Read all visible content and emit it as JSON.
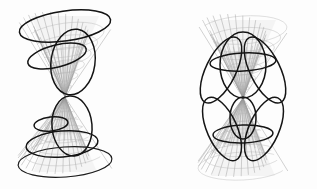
{
  "figure": {
    "width": 317,
    "height": 189,
    "background_color": "#fdfdfd",
    "mesh_color": "#9a9a9a",
    "curve_color": "#141414",
    "shade_color": "#d8d8d8",
    "panel_count": 2,
    "panels": [
      {
        "id": "left",
        "name": "non-degenerate-conics",
        "caption": "",
        "apex": {
          "x": 65,
          "y": 97
        },
        "axis_vertical": true,
        "cone": {
          "type": "double-cone",
          "upper_rim": {
            "cx": 65,
            "cy": 26,
            "rx": 46,
            "ry": 15,
            "rotation_deg": -8
          },
          "lower_rim": {
            "cx": 65,
            "cy": 162,
            "rx": 47,
            "ry": 15,
            "rotation_deg": -4
          },
          "meridian_count": 24,
          "parallel_count": 7
        },
        "conic_curves": [
          {
            "name": "upper-rim-ellipse",
            "kind": "ellipse",
            "cx": 65,
            "cy": 26,
            "rx": 46,
            "ry": 15,
            "rotation_deg": -8,
            "weight": "bold"
          },
          {
            "name": "tilted-ellipse-upper",
            "kind": "ellipse",
            "cx": 57,
            "cy": 56,
            "rx": 30,
            "ry": 11,
            "rotation_deg": -14,
            "weight": "bold"
          },
          {
            "name": "steep-ellipse-upper",
            "kind": "ellipse",
            "cx": 73,
            "cy": 62,
            "rx": 22,
            "ry": 33,
            "rotation_deg": 8,
            "weight": "bold"
          },
          {
            "name": "small-ellipse-lower",
            "kind": "ellipse",
            "cx": 51,
            "cy": 124,
            "rx": 17,
            "ry": 7,
            "rotation_deg": -6,
            "weight": "bold"
          },
          {
            "name": "large-ellipse-lower",
            "kind": "ellipse",
            "cx": 62,
            "cy": 144,
            "rx": 36,
            "ry": 13,
            "rotation_deg": -5,
            "weight": "bold"
          },
          {
            "name": "steep-ellipse-lower",
            "kind": "ellipse",
            "cx": 72,
            "cy": 126,
            "rx": 20,
            "ry": 30,
            "rotation_deg": -5,
            "weight": "bold"
          },
          {
            "name": "lower-rim-ellipse",
            "kind": "ellipse",
            "cx": 65,
            "cy": 162,
            "rx": 47,
            "ry": 15,
            "rotation_deg": -4,
            "weight": "thin"
          }
        ]
      },
      {
        "id": "right",
        "name": "degenerate-conics-through-vertex",
        "caption": "",
        "apex": {
          "x": 243,
          "y": 98
        },
        "axis_vertical": true,
        "cone": {
          "type": "double-cone",
          "upper_rim": {
            "cx": 243,
            "cy": 30,
            "rx": 44,
            "ry": 14,
            "rotation_deg": -4
          },
          "lower_rim": {
            "cx": 243,
            "cy": 166,
            "rx": 45,
            "ry": 14,
            "rotation_deg": -3
          },
          "meridian_count": 24,
          "parallel_count": 7
        },
        "conic_curves": [
          {
            "name": "petal-upper-left",
            "kind": "vertex-ellipse",
            "weight": "bold"
          },
          {
            "name": "petal-upper-center",
            "kind": "vertex-ellipse",
            "weight": "bold"
          },
          {
            "name": "petal-upper-right",
            "kind": "vertex-ellipse",
            "weight": "bold"
          },
          {
            "name": "chord-upper",
            "kind": "ellipse",
            "cx": 243,
            "cy": 62,
            "rx": 33,
            "ry": 9,
            "rotation_deg": -3,
            "weight": "bold"
          },
          {
            "name": "petal-lower-left",
            "kind": "vertex-ellipse",
            "weight": "bold"
          },
          {
            "name": "petal-lower-center-small",
            "kind": "vertex-ellipse",
            "weight": "bold"
          },
          {
            "name": "petal-lower-right",
            "kind": "vertex-ellipse",
            "weight": "bold"
          },
          {
            "name": "chord-lower",
            "kind": "ellipse",
            "cx": 243,
            "cy": 134,
            "rx": 30,
            "ry": 9,
            "rotation_deg": -2,
            "weight": "bold"
          }
        ]
      }
    ]
  }
}
